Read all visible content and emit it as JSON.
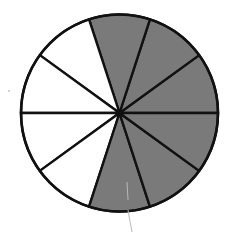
{
  "figure": {
    "total_slices": 10,
    "shaded_slices": 6,
    "unshaded_slices": 4,
    "fraction_shaded": "6/10",
    "colors": {
      "shaded": "#7a7a7a",
      "unshaded": "#ffffff",
      "stroke": "#111111",
      "stray_line": "#b8b8b8"
    },
    "geometry": {
      "cx": 119.5,
      "cy": 113,
      "r": 98.5
    },
    "slices": [
      {
        "start_deg": 0,
        "end_deg": 36,
        "shaded": true
      },
      {
        "start_deg": 36,
        "end_deg": 72,
        "shaded": true
      },
      {
        "start_deg": 72,
        "end_deg": 108,
        "shaded": true
      },
      {
        "start_deg": 108,
        "end_deg": 144,
        "shaded": false
      },
      {
        "start_deg": 144,
        "end_deg": 180,
        "shaded": false
      },
      {
        "start_deg": 180,
        "end_deg": 216,
        "shaded": false
      },
      {
        "start_deg": 216,
        "end_deg": 252,
        "shaded": false
      },
      {
        "start_deg": 252,
        "end_deg": 288,
        "shaded": true
      },
      {
        "start_deg": 288,
        "end_deg": 324,
        "shaded": true
      },
      {
        "start_deg": 324,
        "end_deg": 360,
        "shaded": true
      }
    ]
  }
}
